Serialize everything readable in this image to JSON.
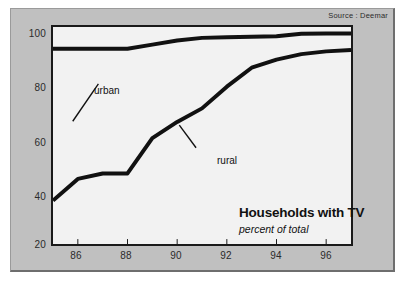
{
  "source_note": "Source : Deemar",
  "chart_data": {
    "type": "line",
    "title": "Households with TV",
    "subtitle": "percent of total",
    "xlabel": "",
    "ylabel": "",
    "xlim": [
      85,
      97
    ],
    "ylim": [
      20,
      100
    ],
    "grid": false,
    "legend_position": "inline-annotations",
    "x": [
      85,
      86,
      87,
      88,
      89,
      90,
      91,
      92,
      93,
      94,
      95,
      96,
      97
    ],
    "xtick_labels": [
      "86",
      "88",
      "90",
      "92",
      "94",
      "96"
    ],
    "xtick_values": [
      86,
      88,
      90,
      92,
      94,
      96
    ],
    "ytick_labels": [
      "100",
      "80",
      "60",
      "40",
      "20"
    ],
    "ytick_values": [
      100,
      80,
      60,
      40,
      20
    ],
    "series": [
      {
        "name": "urban",
        "label": "urban",
        "color": "#111111",
        "values": [
          92,
          92,
          92,
          92,
          93.5,
          95,
          96,
          96.2,
          96.4,
          96.6,
          97.5,
          97.6,
          97.6
        ]
      },
      {
        "name": "rural",
        "label": "rural",
        "color": "#111111",
        "values": [
          36,
          44,
          46,
          46,
          59,
          65,
          70,
          78,
          85,
          88,
          90,
          91,
          91.5
        ]
      }
    ],
    "annotations": [
      {
        "text": "urban",
        "series": "urban"
      },
      {
        "text": "rural",
        "series": "rural"
      }
    ]
  }
}
